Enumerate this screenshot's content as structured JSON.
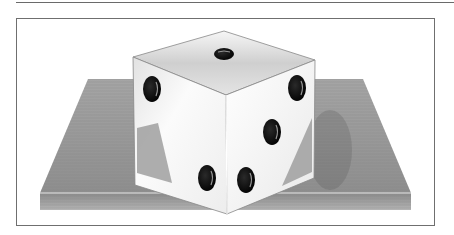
{
  "figure": {
    "die": {
      "visible_faces": {
        "top": 1,
        "left": 1,
        "right_front": 4
      }
    },
    "colors": {
      "frame_border": "#6f6f6f",
      "die_face": "#f4f4f4",
      "die_shadow": "#cfcfcf",
      "pip": "#111111",
      "wood_top": "#9a9a9a",
      "wood_edge": "#7c7c7c"
    }
  }
}
